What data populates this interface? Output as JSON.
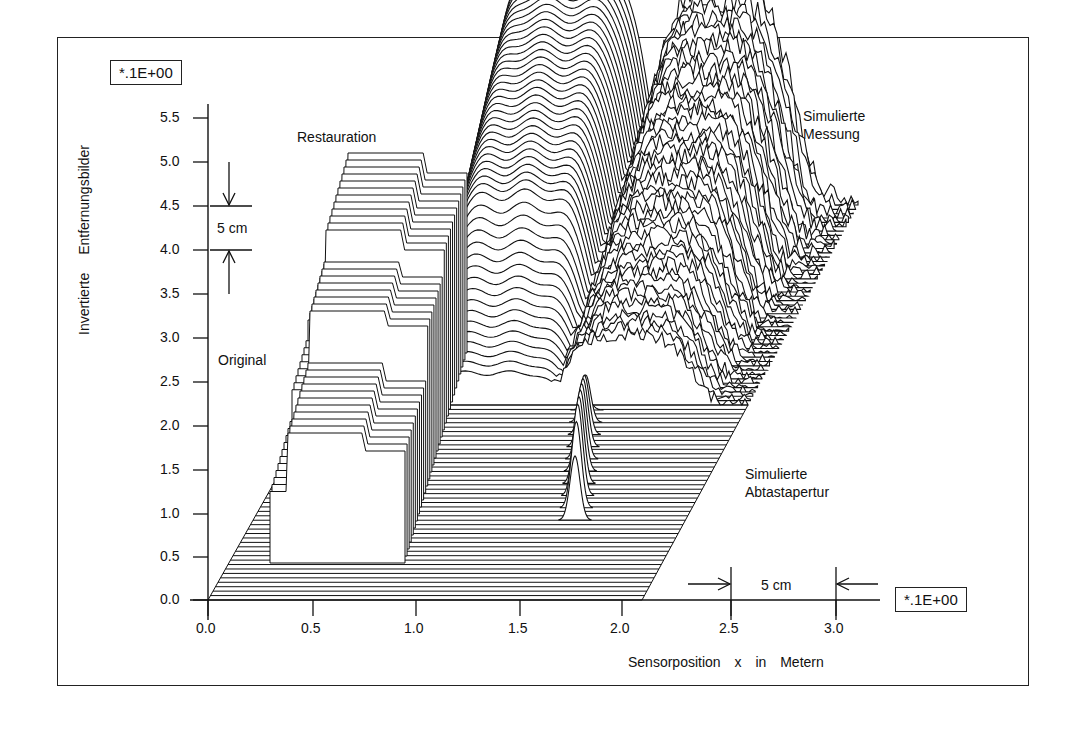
{
  "chart_data": {
    "type": "3d-waterfall",
    "title": "",
    "xlabel": "Sensorposition  x  in  Metern",
    "ylabel": "Invertierte  Entfernungsbilder",
    "x_scale_note": "*.1E+00",
    "y_scale_note": "*.1E+00",
    "xlim": [
      0.0,
      3.0
    ],
    "ylim": [
      0.0,
      5.5
    ],
    "x_ticks": [
      "0.0",
      "0.5",
      "1.0",
      "1.5",
      "2.0",
      "2.5",
      "3.0"
    ],
    "y_ticks": [
      "0.0",
      "0.5",
      "1.0",
      "1.5",
      "2.0",
      "2.5",
      "3.0",
      "3.5",
      "4.0",
      "4.5",
      "5.0",
      "5.5"
    ],
    "grid": false,
    "legend": null,
    "annotations": [
      {
        "text": "Restauration",
        "description": "smooth reconstructed surface, back-left block"
      },
      {
        "text": "Simulierte Messung",
        "description": "noisy simulated measurement surface, back-right block"
      },
      {
        "text": "Original",
        "description": "step-shaped original object profile, front-left"
      },
      {
        "text": "Simulierte Abtastapertur",
        "description": "narrow peak aperture on the front floor plane near x~1.8"
      },
      {
        "text": "5 cm",
        "description": "vertical scale bar between y 4.0 and 4.5"
      },
      {
        "text": "5 cm",
        "description": "horizontal scale bar between x 2.5 and 3.0"
      }
    ],
    "series": [
      {
        "name": "Original",
        "approx_extent_x": [
          0.3,
          0.95
        ],
        "approx_height_range": [
          0.5,
          3.2
        ]
      },
      {
        "name": "Restauration",
        "approx_extent_x": [
          1.0,
          1.75
        ],
        "approx_peak_y": 5.6
      },
      {
        "name": "Simulierte Messung",
        "approx_extent_x": [
          1.6,
          2.6
        ],
        "approx_peak_y": 5.6
      },
      {
        "name": "Simulierte Abtastapertur",
        "approx_center_x": 1.8,
        "approx_peak_y": 2.2
      }
    ]
  },
  "labels": {
    "y_scale_box": "*.1E+00",
    "x_scale_box": "*.1E+00",
    "ylabel": "Invertierte Entfernungsbilder",
    "xlabel": "Sensorposition  x  in  Metern",
    "restauration": "Restauration",
    "messung_1": "Simulierte",
    "messung_2": "Messung",
    "original": "Original",
    "apertur_1": "Simulierte",
    "apertur_2": "Abtastapertur",
    "scale_v": "5 cm",
    "scale_h": "5 cm"
  },
  "ticks": {
    "y": [
      {
        "label": "5.5",
        "py": 118
      },
      {
        "label": "5.0",
        "py": 162
      },
      {
        "label": "4.5",
        "py": 206
      },
      {
        "label": "4.0",
        "py": 250
      },
      {
        "label": "3.5",
        "py": 294
      },
      {
        "label": "3.0",
        "py": 338
      },
      {
        "label": "2.5",
        "py": 382
      },
      {
        "label": "2.0",
        "py": 426
      },
      {
        "label": "1.5",
        "py": 470
      },
      {
        "label": "1.0",
        "py": 514
      },
      {
        "label": "0.5",
        "py": 557
      },
      {
        "label": "0.0",
        "py": 600
      }
    ],
    "x": [
      {
        "label": "0.0",
        "px": 208
      },
      {
        "label": "0.5",
        "px": 313
      },
      {
        "label": "1.0",
        "px": 416
      },
      {
        "label": "1.5",
        "px": 520
      },
      {
        "label": "2.0",
        "px": 622
      },
      {
        "label": "2.5",
        "px": 731
      },
      {
        "label": "3.0",
        "px": 836
      }
    ]
  }
}
